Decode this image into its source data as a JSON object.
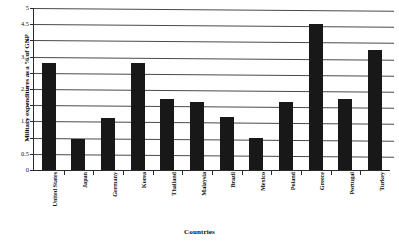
{
  "chart_data": {
    "type": "bar",
    "title": "",
    "xlabel": "Countries",
    "ylabel": "Military expenditures as a % of GNP",
    "ylim": [
      0,
      5
    ],
    "ytick_step": 0.5,
    "grid": true,
    "legend": "none",
    "orientation": "vertical",
    "bar_color": "#181818",
    "categories": [
      "United States",
      "Japan",
      "Germany",
      "Korea",
      "Thailand",
      "Malaysia",
      "Brazil",
      "Mexico",
      "Poland",
      "Greece",
      "Portugal",
      "Turkey"
    ],
    "values": [
      3.3,
      0.95,
      1.6,
      3.3,
      2.2,
      2.1,
      1.65,
      1.0,
      2.1,
      4.5,
      2.2,
      3.7
    ],
    "ytick_labels": [
      "0",
      "0.5",
      "1",
      "1.5",
      "2",
      "2.5",
      "3",
      "3.5",
      "4",
      "4.5",
      "5"
    ],
    "ytick_values": [
      0,
      0.5,
      1,
      1.5,
      2,
      2.5,
      3,
      3.5,
      4,
      4.5,
      5
    ]
  }
}
